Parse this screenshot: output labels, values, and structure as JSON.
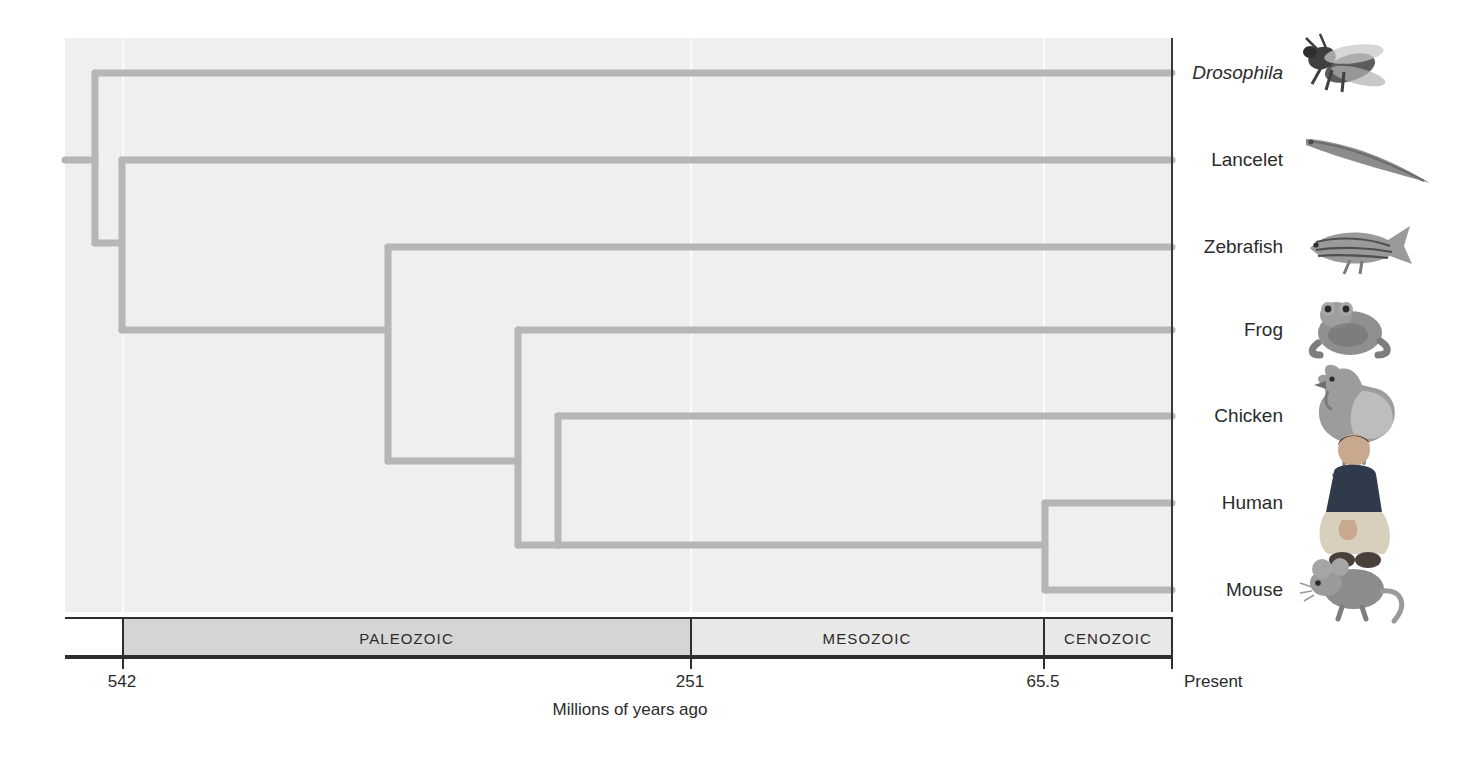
{
  "figure": {
    "axis_title": "Millions of years ago",
    "present_label": "Present"
  },
  "chart_data": {
    "type": "tree",
    "title": "",
    "xlabel": "Millions of years ago",
    "ylabel": "",
    "x_axis_direction": "reversed",
    "x_ticks": [
      {
        "label": "542",
        "value": 542
      },
      {
        "label": "251",
        "value": 251
      },
      {
        "label": "65.5",
        "value": 65.5
      },
      {
        "label": "Present",
        "value": 0
      }
    ],
    "xlim": [
      600,
      0
    ],
    "grid": false,
    "eras": [
      {
        "label": "PALEOZOIC",
        "start": 542,
        "end": 251
      },
      {
        "label": "MESOZOIC",
        "start": 251,
        "end": 65.5
      },
      {
        "label": "CENOZOIC",
        "start": 65.5,
        "end": 0
      }
    ],
    "taxa": [
      {
        "name": "Drosophila",
        "italic": true,
        "icon": "fly-icon",
        "tip_y": 73
      },
      {
        "name": "Lancelet",
        "italic": false,
        "icon": "lancelet-icon",
        "tip_y": 160
      },
      {
        "name": "Zebrafish",
        "italic": false,
        "icon": "zebrafish-icon",
        "tip_y": 247
      },
      {
        "name": "Frog",
        "italic": false,
        "icon": "frog-icon",
        "tip_y": 330
      },
      {
        "name": "Chicken",
        "italic": false,
        "icon": "chicken-icon",
        "tip_y": 416
      },
      {
        "name": "Human",
        "italic": false,
        "icon": "human-icon",
        "tip_y": 503
      },
      {
        "name": "Mouse",
        "italic": false,
        "icon": "mouse-icon",
        "tip_y": 590
      }
    ],
    "nodes": [
      {
        "id": "root",
        "divergence_x": 95,
        "children_y": [
          73,
          243
        ]
      },
      {
        "id": "chordate",
        "divergence_x": 122,
        "children_y": [
          160,
          330
        ]
      },
      {
        "id": "vertebrate",
        "divergence_x": 388,
        "children_y": [
          247,
          461
        ]
      },
      {
        "id": "tetrapod",
        "divergence_x": 518,
        "children_y": [
          330,
          545
        ]
      },
      {
        "id": "amniote",
        "divergence_x": 558,
        "children_y": [
          416,
          545
        ]
      },
      {
        "id": "mammal",
        "divergence_x": 1045,
        "children_y": [
          503,
          590
        ]
      }
    ],
    "branch_color": "#b6b6b6",
    "panel_color": "#efefef"
  },
  "colors": {
    "branch": "#b6b6b6",
    "panel": "#efefef",
    "axis": "#2e2e2e",
    "era_shaded": "#d5d5d5",
    "era_light": "#e8e8e8",
    "text": "#2b2b2b"
  }
}
